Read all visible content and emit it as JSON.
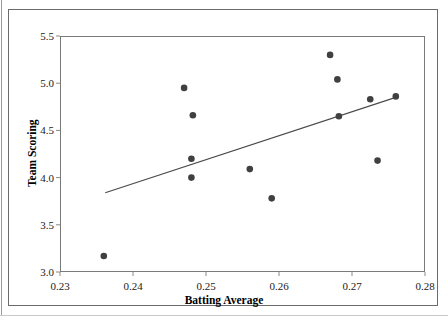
{
  "chart_data": {
    "type": "scatter",
    "title": "",
    "xlabel": "Batting Average",
    "ylabel": "Team Scoring",
    "xlim": [
      0.23,
      0.28
    ],
    "ylim": [
      3.0,
      5.5
    ],
    "xticks": [
      "0.23",
      "0.24",
      "0.25",
      "0.26",
      "0.27",
      "0.28"
    ],
    "xtick_values": [
      0.23,
      0.24,
      0.25,
      0.26,
      0.27,
      0.28
    ],
    "yticks": [
      "5.5",
      "5.0",
      "4.5",
      "4.0",
      "3.5",
      "3.0"
    ],
    "ytick_values": [
      5.5,
      5.0,
      4.5,
      4.0,
      3.5,
      3.0
    ],
    "grid": false,
    "legend": "none",
    "marker_color": "#404040",
    "line_color": "#4a4a4a",
    "frame_color": "#7a7a7a",
    "points": [
      {
        "x": 0.236,
        "y": 3.17
      },
      {
        "x": 0.247,
        "y": 4.95
      },
      {
        "x": 0.2482,
        "y": 4.66
      },
      {
        "x": 0.248,
        "y": 4.2
      },
      {
        "x": 0.248,
        "y": 4.0
      },
      {
        "x": 0.256,
        "y": 4.09
      },
      {
        "x": 0.259,
        "y": 3.78
      },
      {
        "x": 0.267,
        "y": 5.3
      },
      {
        "x": 0.268,
        "y": 5.04
      },
      {
        "x": 0.2682,
        "y": 4.65
      },
      {
        "x": 0.2725,
        "y": 4.83
      },
      {
        "x": 0.2735,
        "y": 4.18
      },
      {
        "x": 0.276,
        "y": 4.86
      }
    ],
    "trendline": {
      "type": "linear-fit",
      "x_start": 0.2362,
      "y_start": 3.84,
      "x_end": 0.276,
      "y_end": 4.85
    }
  }
}
